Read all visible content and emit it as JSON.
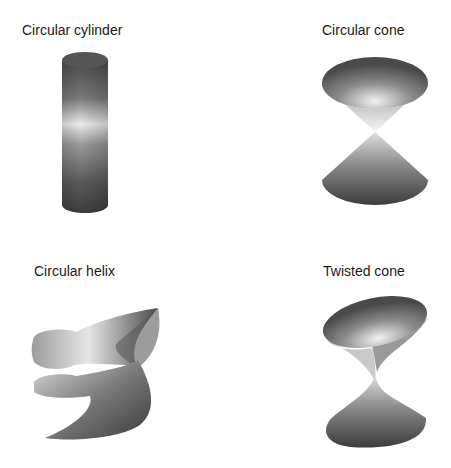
{
  "figures": [
    {
      "id": "circular-cylinder",
      "title": "Circular cylinder"
    },
    {
      "id": "circular-cone",
      "title": "Circular cone"
    },
    {
      "id": "circular-helix",
      "title": "Circular helix"
    },
    {
      "id": "twisted-cone",
      "title": "Twisted cone"
    }
  ],
  "colors": {
    "background": "#ffffff",
    "text": "#1a1a1a",
    "surface_dark": "#3c3c3c",
    "surface_mid": "#808080",
    "surface_light": "#f0f0f0"
  }
}
